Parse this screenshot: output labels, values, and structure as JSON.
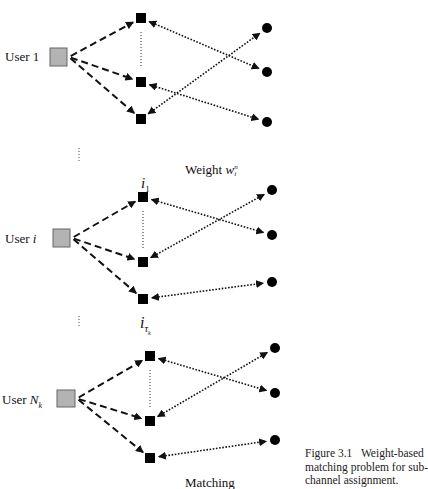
{
  "users": [
    {
      "label_prefix": "User ",
      "label_var": "1",
      "italic": false,
      "box": [
        50,
        48,
        17,
        18
      ],
      "label_pos": [
        5,
        50
      ],
      "subchannels": [
        [
          141,
          18
        ],
        [
          141,
          82
        ],
        [
          141,
          119
        ]
      ],
      "circles": [
        [
          267,
          28
        ],
        [
          267,
          72
        ],
        [
          267,
          122
        ]
      ],
      "matches": [
        [
          0,
          1
        ],
        [
          1,
          2
        ],
        [
          2,
          0
        ]
      ]
    },
    {
      "label_prefix": "User ",
      "label_var": "i",
      "italic": true,
      "box": [
        53,
        229,
        17,
        18
      ],
      "label_pos": [
        5,
        232
      ],
      "subchannels": [
        [
          143,
          197
        ],
        [
          143,
          262
        ],
        [
          143,
          299
        ]
      ],
      "circles": [
        [
          272,
          190
        ],
        [
          272,
          235
        ],
        [
          272,
          282
        ]
      ],
      "matches": [
        [
          0,
          1
        ],
        [
          1,
          0
        ],
        [
          2,
          2
        ]
      ]
    },
    {
      "label_prefix": "User ",
      "label_var": "N",
      "var_sub": "k",
      "italic": true,
      "box": [
        57,
        390,
        18,
        17
      ],
      "label_pos": [
        2,
        393
      ],
      "subchannels": [
        [
          150,
          356
        ],
        [
          150,
          421
        ],
        [
          150,
          458
        ]
      ],
      "circles": [
        [
          275,
          348
        ],
        [
          275,
          393
        ],
        [
          275,
          440
        ]
      ],
      "matches": [
        [
          0,
          1
        ],
        [
          1,
          0
        ],
        [
          2,
          2
        ]
      ]
    }
  ],
  "subchannel_labels": {
    "first": "i",
    "first_sub": "1",
    "last": "i",
    "last_sub": "τ",
    "last_subsub": "k"
  },
  "weight_label": {
    "text": "Weight ",
    "var": "w",
    "sup": "n",
    "sub": "i"
  },
  "matching_label": "Matching",
  "caption": {
    "number": "Figure 3.1",
    "text": "Weight-based matching problem for sub-channel assignment."
  },
  "colors": {
    "user_box_fill": "#b3b3b3",
    "user_box_stroke": "#666666",
    "node": "#000000",
    "line": "#111111"
  }
}
